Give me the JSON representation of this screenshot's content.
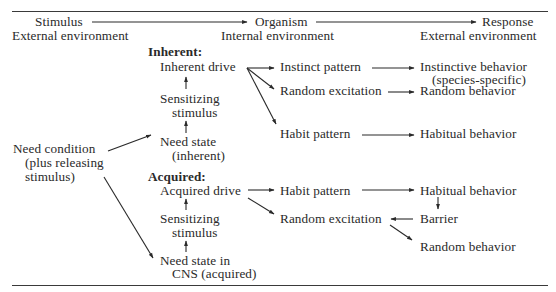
{
  "header": {
    "stimulus": "Stimulus",
    "stimulus_env": "External environment",
    "organism": "Organism",
    "organism_env": "Internal environment",
    "response": "Response",
    "response_env": "External environment"
  },
  "need_condition": {
    "line1": "Need condition",
    "line2": "(plus releasing",
    "line3": "stimulus)"
  },
  "inherent": {
    "heading": "Inherent:",
    "drive": "Inherent drive",
    "sensitizing_1": "Sensitizing",
    "sensitizing_2": "stimulus",
    "need_state_1": "Need state",
    "need_state_2": "(inherent)",
    "instinct_pattern": "Instinct pattern",
    "random_excitation": "Random excitation",
    "habit_pattern": "Habit pattern",
    "instinctive_behavior_1": "Instinctive behavior",
    "instinctive_behavior_2": "(species-specific)",
    "random_behavior": "Random behavior",
    "habitual_behavior": "Habitual behavior"
  },
  "acquired": {
    "heading": "Acquired:",
    "drive": "Acquired drive",
    "sensitizing_1": "Sensitizing",
    "sensitizing_2": "stimulus",
    "need_state_1": "Need state in",
    "need_state_2": "CNS (acquired)",
    "habit_pattern": "Habit pattern",
    "random_excitation": "Random excitation",
    "habitual_behavior": "Habitual behavior",
    "barrier": "Barrier",
    "random_behavior": "Random behavior"
  }
}
